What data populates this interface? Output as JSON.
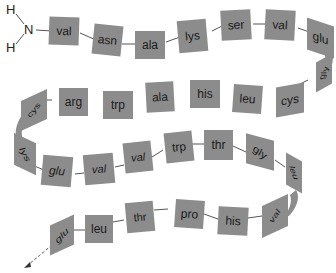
{
  "diagram": {
    "type": "polypeptide-chain",
    "terminus": {
      "nitrogen": "N",
      "hydrogen_top": "H",
      "hydrogen_bottom": "H"
    },
    "colors": {
      "residue_fill": "#8c8c8c",
      "text": "#1a1a1a",
      "bond": "#555555",
      "background": "#ffffff"
    },
    "residues": [
      {
        "label": "val"
      },
      {
        "label": "asn"
      },
      {
        "label": "ala"
      },
      {
        "label": "lys"
      },
      {
        "label": "ser"
      },
      {
        "label": "val"
      },
      {
        "label": "glu"
      },
      {
        "label": "gly"
      },
      {
        "label": "cys"
      },
      {
        "label": "leu"
      },
      {
        "label": "his"
      },
      {
        "label": "ala"
      },
      {
        "label": "trp"
      },
      {
        "label": "arg"
      },
      {
        "label": "cys"
      },
      {
        "label": "lys"
      },
      {
        "label": "glu"
      },
      {
        "label": "val"
      },
      {
        "label": "val"
      },
      {
        "label": "trp"
      },
      {
        "label": "thr"
      },
      {
        "label": "gly"
      },
      {
        "label": "leu"
      },
      {
        "label": "val"
      },
      {
        "label": "his"
      },
      {
        "label": "pro"
      },
      {
        "label": "thr"
      },
      {
        "label": "leu"
      },
      {
        "label": "glu"
      }
    ]
  }
}
